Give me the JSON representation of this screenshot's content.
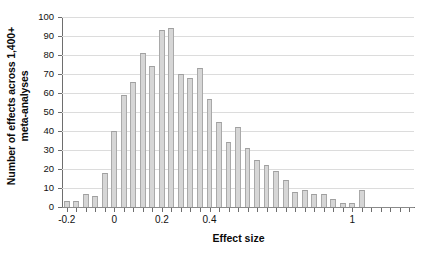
{
  "chart_data": {
    "type": "bar",
    "title": "",
    "subtitle": "",
    "xlabel": "Effect size",
    "ylabel": "Number of effects across 1,400+ meta-analyses",
    "ylabel_line1": "Number of effects across 1,400+",
    "ylabel_line2": "meta-analyses",
    "ylim": [
      0,
      100
    ],
    "xlim": [
      -0.22,
      1.26
    ],
    "bin_width": 0.04,
    "grid": true,
    "grid_axis": "y",
    "legend": "none",
    "bar_color": "#d6d6d6",
    "bar_edge_color": "#a9a9a9",
    "axis_color": "#6e6e6e",
    "gridline_color": "#dcdcdc",
    "yticks": [
      0,
      10,
      20,
      30,
      40,
      50,
      60,
      70,
      80,
      90,
      100
    ],
    "ytick_labels": [
      "0",
      "10",
      "20",
      "30",
      "40",
      "50",
      "60",
      "70",
      "80",
      "90",
      "100"
    ],
    "xtick_labels": [
      "-0.2",
      "0",
      "0.2",
      "0.4",
      "1"
    ],
    "xtick_values": [
      -0.2,
      0,
      0.2,
      0.4,
      1
    ],
    "x": [
      -0.2,
      -0.16,
      -0.12,
      -0.08,
      -0.04,
      0.0,
      0.04,
      0.08,
      0.12,
      0.16,
      0.2,
      0.24,
      0.28,
      0.32,
      0.36,
      0.4,
      0.44,
      0.48,
      0.52,
      0.56,
      0.6,
      0.64,
      0.68,
      0.72,
      0.76,
      0.8,
      0.84,
      0.88,
      0.92,
      0.96,
      1.0,
      1.04,
      1.08,
      1.12,
      1.16,
      1.2,
      1.24
    ],
    "categories": [
      "-0.20",
      "-0.16",
      "-0.12",
      "-0.08",
      "-0.04",
      "0.00",
      "0.04",
      "0.08",
      "0.12",
      "0.16",
      "0.20",
      "0.24",
      "0.28",
      "0.32",
      "0.36",
      "0.40",
      "0.44",
      "0.48",
      "0.52",
      "0.56",
      "0.60",
      "0.64",
      "0.68",
      "0.72",
      "0.76",
      "0.80",
      "0.84",
      "0.88",
      "0.92",
      "0.96",
      "1.00",
      "1.04",
      "1.08",
      "1.12",
      "1.16",
      "1.20",
      "1.24"
    ],
    "values": [
      3,
      3,
      7,
      6,
      18,
      40,
      59,
      66,
      81,
      74,
      93,
      94,
      70,
      68,
      73,
      57,
      45,
      34,
      42,
      31,
      25,
      22,
      19,
      14,
      8,
      9,
      7,
      7,
      4,
      2,
      2,
      9,
      0,
      0,
      0,
      0,
      0
    ],
    "series": [
      {
        "name": "Number of effects",
        "values": [
          3,
          3,
          7,
          6,
          18,
          40,
          59,
          66,
          81,
          74,
          93,
          94,
          70,
          68,
          73,
          57,
          45,
          34,
          42,
          31,
          25,
          22,
          19,
          14,
          8,
          9,
          7,
          7,
          4,
          2,
          2,
          9,
          0,
          0,
          0,
          0,
          0
        ]
      }
    ],
    "annotations": []
  }
}
